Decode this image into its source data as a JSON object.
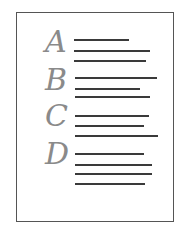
{
  "illustration": {
    "description": "document outline icon",
    "border_color": "#555555",
    "letter_color": "#8a8a8a",
    "line_color": "#3a3a3a"
  },
  "sections": [
    {
      "letter": "A",
      "top": 24
    },
    {
      "letter": "B",
      "top": 62
    },
    {
      "letter": "C",
      "top": 98
    },
    {
      "letter": "D",
      "top": 138
    }
  ]
}
